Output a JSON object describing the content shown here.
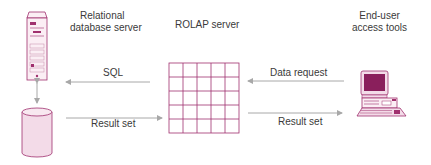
{
  "diagram": {
    "nodes": {
      "db_server": {
        "label_line1": "Relational",
        "label_line2": "database server"
      },
      "rolap_server": {
        "label": "ROLAP server"
      },
      "end_user": {
        "label_line1": "End-user",
        "label_line2": "access tools"
      },
      "database": {
        "label": ""
      }
    },
    "edges": {
      "sql": {
        "label": "SQL"
      },
      "result_set_left": {
        "label": "Result set"
      },
      "data_request": {
        "label": "Data request"
      },
      "result_set_right": {
        "label": "Result set"
      }
    },
    "colors": {
      "accent": "#a0306e",
      "accent_dark": "#8a1f5c",
      "accent_light": "#f3dbe8",
      "arrow": "#a8a8a8"
    },
    "grid": {
      "rows": 5,
      "cols": 5
    }
  }
}
